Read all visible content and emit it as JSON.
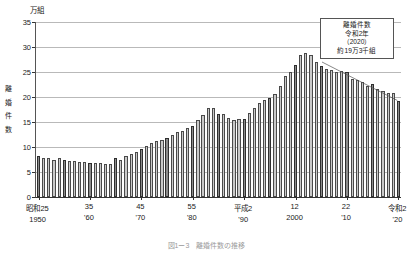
{
  "chart_data": {
    "type": "bar",
    "title": "図1ー3　離婚件数の推移",
    "unit_label": "万組",
    "ylabel": "離婚件数",
    "xlabel": "",
    "ylim": [
      0,
      35
    ],
    "yticks": [
      0,
      5,
      10,
      15,
      20,
      25,
      30,
      35
    ],
    "grid": true,
    "legend_position": "none",
    "annotations": [
      {
        "name": "peak-2020-callout",
        "lines": [
          "離婚件数",
          "令和2年",
          "（2020）",
          "約19万3千組"
        ],
        "target_year": 2020,
        "target_value": 19.3
      }
    ],
    "x_tick_labels": [
      {
        "era": "昭和25",
        "west": "1950",
        "year": 1950
      },
      {
        "era": "35",
        "west": "'60",
        "year": 1960
      },
      {
        "era": "45",
        "west": "'70",
        "year": 1970
      },
      {
        "era": "55",
        "west": "'80",
        "year": 1980
      },
      {
        "era": "平成24",
        "west": "'90",
        "year": 1990
      },
      {
        "era": "12",
        "west": "2000",
        "year": 2000
      },
      {
        "era": "22",
        "west": "'10",
        "year": 2010
      },
      {
        "era": "令和2",
        "west": "'20",
        "year": 2020
      }
    ],
    "x_tick_labels_fixed": [
      {
        "era": "昭和25",
        "west": "1950"
      },
      {
        "era": "35",
        "west": "'60"
      },
      {
        "era": "45",
        "west": "'70"
      },
      {
        "era": "55",
        "west": "'80"
      },
      {
        "era": "平成2",
        "west": "'90"
      },
      {
        "era": "12",
        "west": "2000"
      },
      {
        "era": "22",
        "west": "'10"
      },
      {
        "era": "令和2",
        "west": "'20"
      }
    ],
    "categories": [
      1950,
      1951,
      1952,
      1953,
      1954,
      1955,
      1956,
      1957,
      1958,
      1959,
      1960,
      1961,
      1962,
      1963,
      1964,
      1965,
      1966,
      1967,
      1968,
      1969,
      1970,
      1971,
      1972,
      1973,
      1974,
      1975,
      1976,
      1977,
      1978,
      1979,
      1980,
      1981,
      1982,
      1983,
      1984,
      1985,
      1986,
      1987,
      1988,
      1989,
      1990,
      1991,
      1992,
      1993,
      1994,
      1995,
      1996,
      1997,
      1998,
      1999,
      2000,
      2001,
      2002,
      2003,
      2004,
      2005,
      2006,
      2007,
      2008,
      2009,
      2010,
      2011,
      2012,
      2013,
      2014,
      2015,
      2016,
      2017,
      2018,
      2019,
      2020
    ],
    "values": [
      8.3,
      7.9,
      7.9,
      7.5,
      7.8,
      7.5,
      7.3,
      7.2,
      7.1,
      7.0,
      6.9,
      6.9,
      6.8,
      6.6,
      6.6,
      7.8,
      7.5,
      8.3,
      8.6,
      9.1,
      9.6,
      10.2,
      10.9,
      11.2,
      11.4,
      11.9,
      12.4,
      13.0,
      13.3,
      13.9,
      14.2,
      15.4,
      16.4,
      17.9,
      17.9,
      16.6,
      16.7,
      15.8,
      15.4,
      15.7,
      15.7,
      16.9,
      17.9,
      18.8,
      19.5,
      19.9,
      20.6,
      22.2,
      24.3,
      25.0,
      26.4,
      28.5,
      28.9,
      28.4,
      27.1,
      26.2,
      25.7,
      25.5,
      25.1,
      25.3,
      25.1,
      23.6,
      23.5,
      23.1,
      22.2,
      22.6,
      21.7,
      21.2,
      20.8,
      20.9,
      19.3
    ],
    "accent_indices": [
      0,
      5,
      10,
      15,
      20,
      25,
      30,
      35,
      40,
      45,
      50,
      55,
      60,
      65,
      70
    ]
  }
}
